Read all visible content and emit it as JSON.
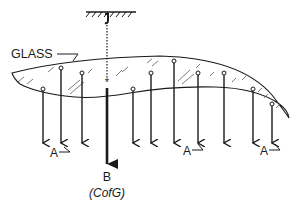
{
  "diagram": {
    "labels": {
      "glass": "GLASS",
      "point_a_1": "A",
      "point_a_2": "A",
      "point_a_3": "A",
      "point_b": "B",
      "cofg": "(CofG)"
    },
    "colors": {
      "ink": "#1a1a1a",
      "background": "#ffffff"
    },
    "elements": {
      "support": "hatched ceiling with hook and dashed suspension line",
      "body": "curved glass sheet with hatching",
      "center_marker": "asterisk marking centre of gravity",
      "force_arrows_count": 10,
      "resultant_arrow": "thick downward arrow B at centre of gravity"
    }
  }
}
